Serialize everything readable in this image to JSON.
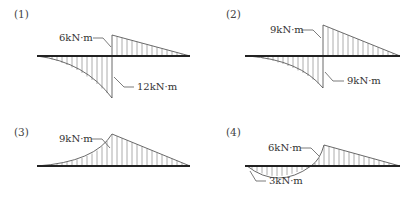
{
  "diagrams": [
    {
      "id": "(1)",
      "labels": [
        "6kN·m",
        "12kN·m"
      ]
    },
    {
      "id": "(2)",
      "labels": [
        "9kN·m",
        "9kN·m"
      ]
    },
    {
      "id": "(3)",
      "labels": [
        "9kN·m"
      ]
    },
    {
      "id": "(4)",
      "labels": [
        "6kN·m",
        "3kN·m"
      ]
    }
  ],
  "colors": {
    "line": "#222222",
    "hatch": "#666666",
    "text": "#333333"
  }
}
